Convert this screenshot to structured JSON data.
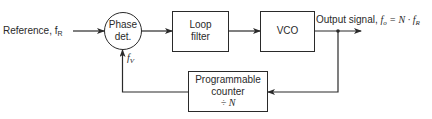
{
  "diagram": {
    "input": {
      "label": "Reference, f",
      "subscript": "R"
    },
    "blocks": [
      {
        "id": "phase-detector",
        "shape": "circle",
        "lines": [
          "Phase",
          "det."
        ]
      },
      {
        "id": "loop-filter",
        "shape": "box",
        "lines": [
          "Loop",
          "filter"
        ]
      },
      {
        "id": "vco",
        "shape": "box",
        "lines": [
          "VCO"
        ]
      },
      {
        "id": "programmable-counter",
        "shape": "box",
        "lines": [
          "Programmable",
          "counter",
          "÷ N"
        ]
      }
    ],
    "output": {
      "label": "Output signal, ",
      "formula_lhs": "f",
      "lhs_sub": "o",
      "formula_rhs": " = N · f",
      "rhs_sub": "R"
    },
    "feedback": {
      "label": "f",
      "subscript": "V"
    },
    "colors": {
      "line": "#2a2a2a",
      "background": "#ffffff"
    }
  }
}
